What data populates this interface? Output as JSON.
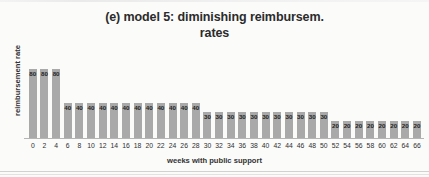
{
  "chart_data": {
    "type": "bar",
    "title": "(e) model 5: diminishing reimbursem. rates",
    "title_line1": "(e) model 5: diminishing reimbursem.",
    "title_line2": "rates",
    "xlabel": "weeks with public support",
    "ylabel": "reimbursement rate",
    "categories": [
      "0",
      "2",
      "4",
      "6",
      "8",
      "10",
      "12",
      "14",
      "16",
      "18",
      "20",
      "22",
      "24",
      "26",
      "28",
      "30",
      "32",
      "34",
      "36",
      "38",
      "40",
      "42",
      "44",
      "46",
      "48",
      "50",
      "52",
      "54",
      "56",
      "58",
      "60",
      "62",
      "64",
      "66"
    ],
    "values": [
      80,
      80,
      80,
      40,
      40,
      40,
      40,
      40,
      40,
      40,
      40,
      40,
      40,
      40,
      40,
      30,
      30,
      30,
      30,
      30,
      30,
      30,
      30,
      30,
      30,
      30,
      20,
      20,
      20,
      20,
      20,
      20,
      20,
      20
    ],
    "ylim": [
      0,
      88
    ],
    "grid": false,
    "legend": null,
    "data_labels": true,
    "bar_color": "#a9a9a9",
    "series": [
      {
        "name": "reimbursement rate",
        "values": [
          80,
          80,
          80,
          40,
          40,
          40,
          40,
          40,
          40,
          40,
          40,
          40,
          40,
          40,
          40,
          30,
          30,
          30,
          30,
          30,
          30,
          30,
          30,
          30,
          30,
          30,
          20,
          20,
          20,
          20,
          20,
          20,
          20,
          20
        ]
      }
    ]
  }
}
